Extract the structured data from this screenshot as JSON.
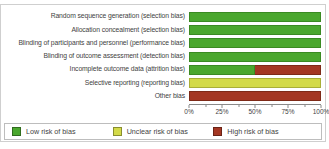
{
  "chart_data": {
    "type": "bar",
    "orientation": "horizontal-stacked",
    "xlabel": "",
    "ylabel": "",
    "xlim": [
      0,
      100
    ],
    "grid": false,
    "legend_position": "bottom",
    "categories": [
      "Random sequence generation (selection bias)",
      "Allocation concealment (selection bias)",
      "Blinding of participants and personnel (performance bias)",
      "Blinding of outcome assessment (detection bias)",
      "Incomplete outcome data (attrition bias)",
      "Selective reporting (reporting bias)",
      "Other bias"
    ],
    "series": [
      {
        "key": "low",
        "name": "Low risk of bias",
        "color": "#4aa72e",
        "border_color": "#3a8a22",
        "values": [
          100,
          100,
          100,
          100,
          50,
          0,
          0
        ]
      },
      {
        "key": "unclear",
        "name": "Unclear risk of bias",
        "color": "#d3da49",
        "border_color": "#a9af37",
        "values": [
          0,
          0,
          0,
          0,
          0,
          100,
          0
        ]
      },
      {
        "key": "high",
        "name": "High risk of bias",
        "color": "#a43723",
        "border_color": "#7e2a18",
        "values": [
          0,
          0,
          0,
          0,
          50,
          0,
          100
        ]
      }
    ],
    "x_major_ticks": [
      {
        "pos": 0,
        "label": "0%"
      },
      {
        "pos": 25,
        "label": "25%"
      },
      {
        "pos": 50,
        "label": "50%"
      },
      {
        "pos": 75,
        "label": "75%"
      },
      {
        "pos": 100,
        "label": "100%"
      }
    ],
    "x_minor_tick_positions": [
      12.5,
      37.5,
      62.5,
      87.5
    ]
  },
  "legend": {
    "items": [
      {
        "key": "low",
        "label": "Low risk of bias",
        "color": "#4aa72e"
      },
      {
        "key": "unclear",
        "label": "Unclear risk of bias",
        "color": "#d3da49"
      },
      {
        "key": "high",
        "label": "High risk of bias",
        "color": "#a43723"
      }
    ]
  }
}
